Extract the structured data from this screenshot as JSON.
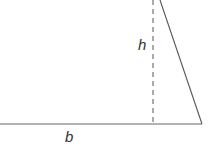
{
  "diagram": {
    "labels": {
      "height": "h",
      "base": "b"
    },
    "colors": {
      "line": "#555555",
      "text": "#333333"
    }
  }
}
